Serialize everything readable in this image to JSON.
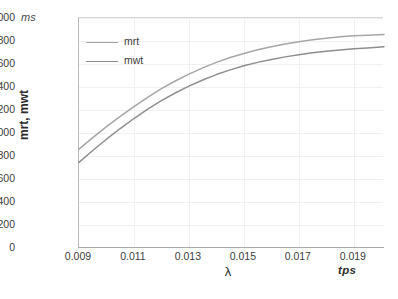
{
  "chart_data": {
    "type": "line",
    "title": "",
    "xlabel": "λ",
    "ylabel": "mrt, mwt",
    "x_unit": "tps",
    "y_unit": "ms",
    "xlim": [
      0.009,
      0.0201
    ],
    "ylim": [
      0,
      2000
    ],
    "y_ticks": [
      2000,
      1800,
      1600,
      1400,
      1200,
      1000,
      800,
      600,
      400,
      200,
      0
    ],
    "x_ticks": [
      "0.009",
      "0.011",
      "0.013",
      "0.015",
      "0.017",
      "0.019"
    ],
    "x_tick_values": [
      0.009,
      0.011,
      0.013,
      0.015,
      0.017,
      0.019
    ],
    "grid": true,
    "legend_position": "top-left",
    "x": [
      0.009,
      0.0095,
      0.01,
      0.0105,
      0.011,
      0.0115,
      0.012,
      0.0125,
      0.013,
      0.0135,
      0.014,
      0.0145,
      0.015,
      0.0155,
      0.016,
      0.0165,
      0.017,
      0.0175,
      0.018,
      0.0185,
      0.019,
      0.0195,
      0.0201
    ],
    "series": [
      {
        "name": "mrt",
        "color": "#a6a6a6",
        "values": [
          860,
          960,
          1055,
          1145,
          1230,
          1310,
          1385,
          1452,
          1512,
          1566,
          1614,
          1656,
          1692,
          1723,
          1750,
          1773,
          1793,
          1810,
          1824,
          1836,
          1845,
          1851,
          1857
        ]
      },
      {
        "name": "mwt",
        "color": "#8e8e8e",
        "values": [
          745,
          848,
          946,
          1039,
          1126,
          1207,
          1281,
          1348,
          1408,
          1461,
          1508,
          1549,
          1584,
          1614,
          1640,
          1662,
          1681,
          1697,
          1711,
          1722,
          1732,
          1740,
          1750
        ]
      }
    ]
  },
  "legend": {
    "items": [
      {
        "label": "mrt"
      },
      {
        "label": "mwt"
      }
    ]
  },
  "axes": {
    "y_unit_label": "ms",
    "x_unit_label": "tps",
    "y_title": "mrt, mwt",
    "x_title": "λ"
  },
  "colors": {
    "series_mrt": "#a6a6a6",
    "series_mwt": "#8e8e8e",
    "gridline": "#f0f0f0",
    "axis": "#a9a9a9",
    "text": "#3f3f3f",
    "background": "#ffffff"
  }
}
